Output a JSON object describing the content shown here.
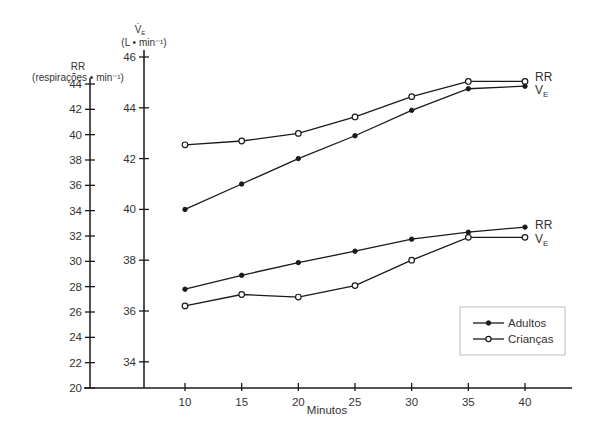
{
  "chart_data": {
    "type": "line",
    "title": "",
    "xlabel": "Minutos",
    "x": [
      10,
      15,
      20,
      25,
      30,
      35,
      40
    ],
    "x_ticks": [
      "10",
      "15",
      "20",
      "25",
      "30",
      "35",
      "40"
    ],
    "y_axes": {
      "rr": {
        "label_line1": "RR",
        "label_line2": "(respirações • min⁻¹)",
        "range": [
          20,
          44
        ],
        "ticks": [
          20,
          22,
          24,
          26,
          28,
          30,
          32,
          34,
          36,
          38,
          40,
          42,
          44
        ]
      },
      "ve": {
        "label_line1": "V̇E",
        "label_line1_main": "V̇",
        "label_line1_sub": "E",
        "label_line2": "(L • min⁻¹)",
        "range": [
          33,
          46
        ],
        "ticks": [
          34,
          36,
          38,
          40,
          42,
          44,
          46
        ]
      }
    },
    "series": [
      {
        "name": "Crianças RR",
        "group": "Crianças",
        "axis": "rr",
        "marker": "open",
        "end_label": "RR",
        "end_label_sub": "",
        "values": [
          39.2,
          39.5,
          40.1,
          41.4,
          43.0,
          44.2,
          44.2
        ]
      },
      {
        "name": "Adultos VE",
        "group": "Adultos",
        "axis": "ve",
        "marker": "filled",
        "end_label": "V",
        "end_label_sub": "E",
        "values": [
          40.0,
          41.0,
          42.0,
          42.9,
          43.9,
          44.75,
          44.85
        ]
      },
      {
        "name": "Adultos RR",
        "group": "Adultos",
        "axis": "rr",
        "marker": "filled",
        "end_label": "RR",
        "end_label_sub": "",
        "values": [
          27.8,
          28.9,
          29.9,
          30.8,
          31.75,
          32.3,
          32.7
        ]
      },
      {
        "name": "Crianças VE",
        "group": "Crianças",
        "axis": "ve",
        "marker": "open",
        "end_label": "V",
        "end_label_sub": "E",
        "values": [
          36.2,
          36.65,
          36.55,
          37.0,
          38.0,
          38.9,
          38.9
        ]
      }
    ],
    "legend": {
      "position": "lower-right",
      "entries": [
        {
          "label": "Adultos",
          "marker": "filled"
        },
        {
          "label": "Crianças",
          "marker": "open"
        }
      ]
    },
    "grid": false
  }
}
